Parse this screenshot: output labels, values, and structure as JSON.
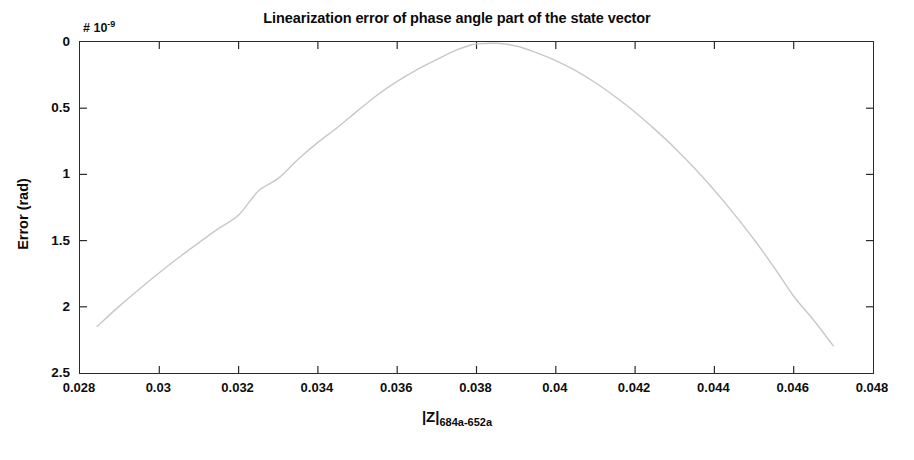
{
  "figure": {
    "title": "Linearization error of phase angle part of the state vector",
    "y_axis_title": "Error (rad)",
    "x_axis_label_base": "|Z|",
    "x_axis_label_sub": "684a-652a",
    "y_exponent_prefix": "# 10",
    "y_exponent_power": "-9",
    "line_color": "#c8c8c8",
    "axis_color": "#2b2b2b",
    "background_color": "#ffffff"
  },
  "chart_data": {
    "type": "line",
    "title": "Linearization error of phase angle part of the state vector",
    "xlabel": "|Z|_684a-652a",
    "ylabel": "Error (rad)",
    "y_scale_note": "values are in units of 1e-9 (× 10^-9)",
    "xlim": [
      0.028,
      0.048
    ],
    "ylim": [
      2.5,
      0
    ],
    "y_inverted": true,
    "grid": false,
    "legend": false,
    "xticks": [
      0.028,
      0.03,
      0.032,
      0.034,
      0.036,
      0.038,
      0.04,
      0.042,
      0.044,
      0.046,
      0.048
    ],
    "xtick_labels": [
      "0.028",
      "0.03",
      "0.032",
      "0.034",
      "0.036",
      "0.038",
      "0.04",
      "0.042",
      "0.044",
      "0.046",
      "0.048"
    ],
    "yticks": [
      0,
      0.5,
      1,
      1.5,
      2,
      2.5
    ],
    "ytick_labels": [
      "0",
      "0.5",
      "1",
      "1.5",
      "2",
      "2.5"
    ],
    "series": [
      {
        "name": "Linearization error",
        "color": "#c8c8c8",
        "x": [
          0.02843,
          0.029,
          0.0295,
          0.03,
          0.0305,
          0.031,
          0.0315,
          0.032,
          0.0325,
          0.033,
          0.0335,
          0.034,
          0.0345,
          0.035,
          0.0355,
          0.036,
          0.0365,
          0.037,
          0.0375,
          0.0378,
          0.038,
          0.0385,
          0.039,
          0.0395,
          0.04,
          0.0405,
          0.041,
          0.0415,
          0.042,
          0.0425,
          0.043,
          0.0435,
          0.044,
          0.0445,
          0.045,
          0.0455,
          0.046,
          0.0465,
          0.047
        ],
        "y": [
          2.148,
          1.993,
          1.865,
          1.743,
          1.626,
          1.515,
          1.408,
          1.307,
          1.126,
          1.03,
          0.886,
          0.758,
          0.644,
          0.52,
          0.4,
          0.298,
          0.208,
          0.132,
          0.06,
          0.028,
          0.014,
          0.01,
          0.03,
          0.08,
          0.14,
          0.216,
          0.308,
          0.414,
          0.53,
          0.66,
          0.8,
          0.954,
          1.12,
          1.3,
          1.492,
          1.7,
          1.92,
          2.1,
          2.295
        ]
      }
    ]
  }
}
